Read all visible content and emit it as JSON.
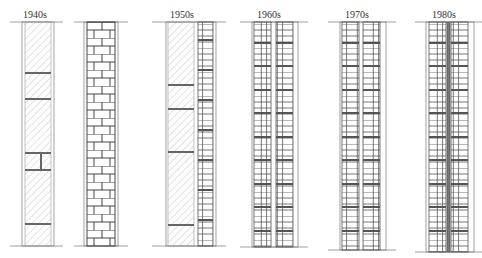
{
  "walls": [
    {
      "id": "1940s-stone",
      "label": "1940s",
      "type": "stone-hatched",
      "x": 20,
      "w": 30
    },
    {
      "id": "1940s-brick",
      "label": "",
      "type": "brick",
      "x": 85,
      "w": 30
    },
    {
      "id": "1950s",
      "label": "1950s",
      "type": "stone-plus-block",
      "x": 165,
      "w": 50
    },
    {
      "id": "1960s",
      "label": "1960s",
      "type": "double-block",
      "x": 253,
      "w": 43
    },
    {
      "id": "1970s",
      "label": "1970s",
      "type": "double-block",
      "x": 341,
      "w": 43
    },
    {
      "id": "1980s",
      "label": "1980s",
      "type": "double-block-insulated",
      "x": 428,
      "w": 43
    }
  ],
  "labels": {
    "l1940": "1940s",
    "l1950": "1950s",
    "l1960": "1960s",
    "l1970": "1970s",
    "l1980": "1980s"
  },
  "colors": {
    "line": "#555555",
    "mortar_dark": "#666666",
    "hatch": "#aaaaaa",
    "ground": "#999999"
  }
}
